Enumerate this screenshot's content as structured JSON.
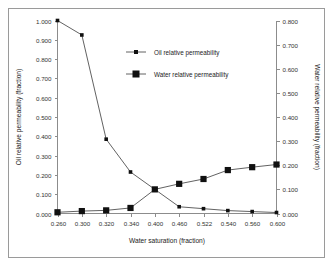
{
  "chart_data": {
    "type": "line",
    "title": "",
    "xlabel": "Water saturation (fraction)",
    "ylabel": "Oil relative permeability (fraction)",
    "y2label": "Water relative permeability (fraction)",
    "categories": [
      "0.260",
      "0.300",
      "0.320",
      "0.340",
      "0.400",
      "0.460",
      "0.522",
      "0.540",
      "0.560",
      "0.600"
    ],
    "x_tick_labels": [
      "0.260",
      "0.300",
      "0.320",
      "0.340",
      "0.400",
      "0.460",
      "0.522",
      "0.540",
      "0.560",
      "0.600"
    ],
    "ylim": [
      0.0,
      1.0
    ],
    "y2lim": [
      0.0,
      0.8
    ],
    "y_tick_labels": [
      "0.000",
      "0.100",
      "0.200",
      "0.300",
      "0.400",
      "0.500",
      "0.600",
      "0.700",
      "0.800",
      "0.900",
      "1.000"
    ],
    "y2_tick_labels": [
      "0.000",
      "0.100",
      "0.200",
      "0.300",
      "0.400",
      "0.500",
      "0.600",
      "0.700",
      "0.800"
    ],
    "grid": false,
    "legend_position": "upper-center",
    "series": [
      {
        "name": "Oil relative permeability",
        "axis": "left",
        "marker": "small-square",
        "values": [
          1.0,
          0.925,
          0.385,
          0.215,
          0.125,
          0.035,
          0.025,
          0.015,
          0.01,
          0.005
        ]
      },
      {
        "name": "Water relative permeability",
        "axis": "right",
        "marker": "large-square",
        "values": [
          0.005,
          0.01,
          0.013,
          0.023,
          0.1,
          0.123,
          0.143,
          0.18,
          0.192,
          0.203
        ]
      }
    ],
    "colors": {
      "series_oil": "#3a3a3a",
      "series_water": "#3a3a3a",
      "axis": "#8c8c8c",
      "text": "#222222",
      "background": "#ffffff",
      "border": "#9a9a9a"
    }
  },
  "legend": {
    "entries": [
      {
        "label": "Oil relative permeability"
      },
      {
        "label": "Water relative permeability"
      }
    ]
  }
}
